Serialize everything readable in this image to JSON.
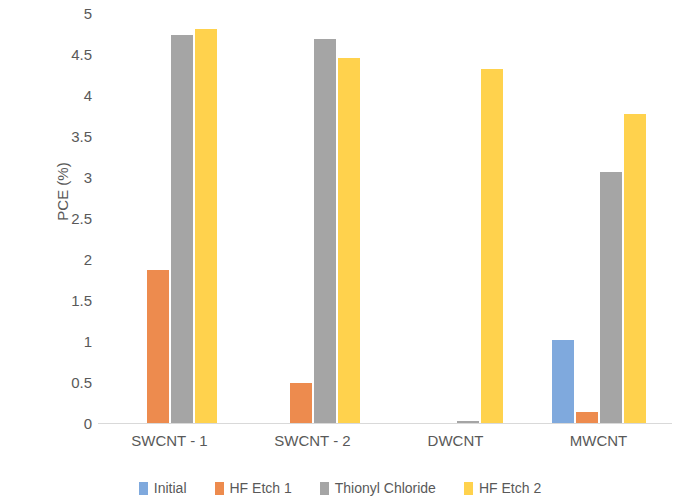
{
  "chart_data": {
    "type": "bar",
    "title": "",
    "xlabel": "",
    "ylabel": "PCE (%)",
    "ylim": [
      0,
      5
    ],
    "ytick_labels": [
      "5",
      "4.5",
      "4",
      "3.5",
      "3",
      "2.5",
      "2",
      "1.5",
      "1",
      "0.5",
      "0"
    ],
    "yticks": [
      5,
      4.5,
      4,
      3.5,
      3,
      2.5,
      2,
      1.5,
      1,
      0.5,
      0
    ],
    "grid": false,
    "legend_position": "bottom",
    "categories": [
      "SWCNT - 1",
      "SWCNT - 2",
      "DWCNT",
      "MWCNT"
    ],
    "series": [
      {
        "name": "Initial",
        "color": "#7FA9DD",
        "values": [
          0,
          0,
          0,
          1.01
        ]
      },
      {
        "name": "HF Etch 1",
        "color": "#ED8B4E",
        "values": [
          1.87,
          0.49,
          0,
          0.13
        ]
      },
      {
        "name": "Thionyl Chloride",
        "color": "#A5A5A5",
        "values": [
          4.73,
          4.68,
          0.02,
          3.06
        ]
      },
      {
        "name": "HF Etch 2",
        "color": "#FFD24D",
        "values": [
          4.8,
          4.45,
          4.32,
          3.77
        ]
      }
    ]
  },
  "axis": {
    "y_title": "PCE (%)"
  }
}
